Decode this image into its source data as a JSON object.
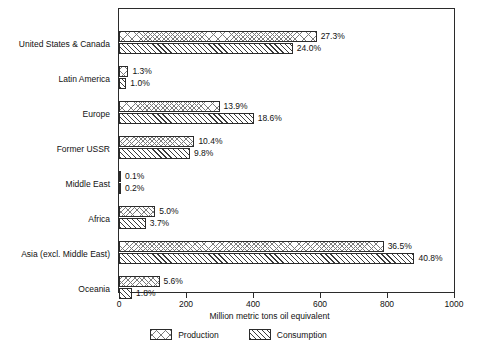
{
  "chart_data": {
    "type": "bar",
    "orientation": "horizontal",
    "title": "",
    "xlabel": "Million metric tons oil equivalent",
    "ylabel": "",
    "xlim": [
      0,
      1000
    ],
    "xticks": [
      0,
      200,
      400,
      600,
      800,
      1000
    ],
    "grid": false,
    "legend_position": "bottom-center",
    "categories": [
      "United States & Canada",
      "Latin America",
      "Europe",
      "Former USSR",
      "Middle East",
      "Africa",
      "Asia (excl. Middle East)",
      "Oceania"
    ],
    "series": [
      {
        "name": "Production",
        "pattern": "cross-hatch",
        "values": [
          590,
          28,
          300,
          225,
          2,
          108,
          790,
          121
        ],
        "labels": [
          "27.3%",
          "1.3%",
          "13.9%",
          "10.4%",
          "0.1%",
          "5.0%",
          "36.5%",
          "5.6%"
        ]
      },
      {
        "name": "Consumption",
        "pattern": "diagonal-hatch",
        "values": [
          519,
          22,
          402,
          212,
          4,
          80,
          882,
          39
        ],
        "labels": [
          "24.0%",
          "1.0%",
          "18.6%",
          "9.8%",
          "0.2%",
          "3.7%",
          "40.8%",
          "1.8%"
        ]
      }
    ]
  },
  "legend": {
    "production_label": "Production",
    "consumption_label": "Consumption"
  },
  "colors": {
    "axis": "#2b2b2b",
    "text": "#111111",
    "production_hatch": "#7a7a7a",
    "consumption_hatch": "#3b3b3b",
    "background": "#ffffff"
  }
}
